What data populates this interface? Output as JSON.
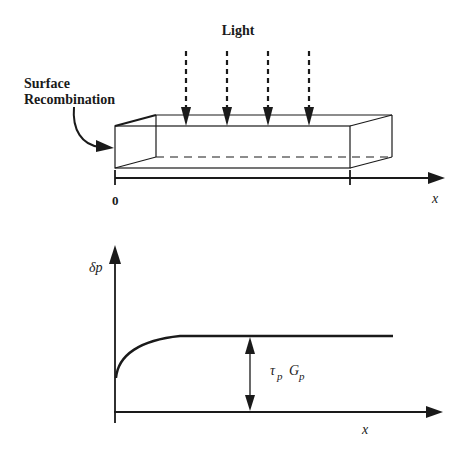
{
  "top_figure": {
    "light_label": "Light",
    "surface_label_line1": "Surface",
    "surface_label_line2": "Recombination",
    "axis_origin_label": "0",
    "axis_label": "x",
    "light_arrow_count": 4
  },
  "bottom_figure": {
    "y_axis_label": "δp",
    "x_axis_label": "x",
    "annotation_tau": "τ",
    "annotation_tau_sub": "p",
    "annotation_G": "G",
    "annotation_G_sub": "p"
  },
  "colors": {
    "ink": "#1a1a1a",
    "background": "#ffffff"
  }
}
